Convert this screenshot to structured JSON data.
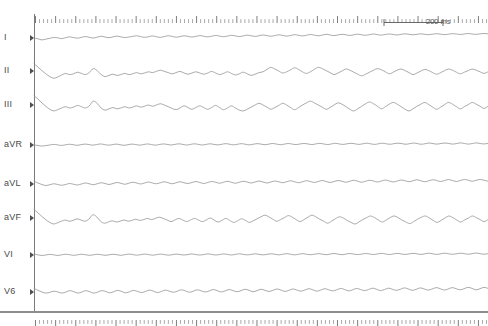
{
  "figure": {
    "type": "ecg-strip",
    "title": "",
    "background_color": "#ffffff",
    "trace_color": "#8e8e8e",
    "axis_color": "#7b7b7b",
    "label_color": "#4a4a4a",
    "width_px": 488,
    "height_px": 326
  },
  "scale": {
    "label": "200 ms",
    "value": 200,
    "unit": "ms",
    "bar_length_px": 60
  },
  "ruler": {
    "top_name": "time-ruler-top",
    "bottom_name": "time-ruler-bottom",
    "major_every": 5,
    "tick_count": 113
  },
  "leads": [
    {
      "label": "I",
      "baseline_y": 38
    },
    {
      "label": "II",
      "baseline_y": 71
    },
    {
      "label": "III",
      "baseline_y": 105
    },
    {
      "label": "aVR",
      "baseline_y": 145
    },
    {
      "label": "aVL",
      "baseline_y": 184
    },
    {
      "label": "aVF",
      "baseline_y": 218
    },
    {
      "label": "VI",
      "baseline_y": 255
    },
    {
      "label": "V6",
      "baseline_y": 292
    }
  ],
  "chart_data": {
    "type": "line",
    "xlabel": "Time",
    "ylabel": "Amplitude",
    "x_unit": "ms",
    "legend_position": "left-labels",
    "grid": false,
    "x_axis": {
      "visible_ruler": true,
      "scale_bar_ms": 200,
      "duration_ms_approx": 1500
    },
    "series": [
      {
        "name": "I",
        "amplitude_scale": 3.2,
        "values": [
          0.0,
          -0.25,
          -0.6,
          -0.35,
          -0.1,
          0.15,
          0.05,
          -0.2,
          0.1,
          0.35,
          0.15,
          -0.05,
          0.2,
          0.45,
          0.2,
          0.0,
          0.25,
          0.55,
          0.3,
          0.1,
          0.35,
          0.6,
          0.35,
          0.15,
          0.3,
          0.5,
          0.7,
          0.45,
          0.2,
          0.4,
          0.65,
          0.4,
          0.2,
          0.45,
          0.7,
          0.5,
          0.25,
          0.45,
          0.7,
          0.5,
          0.3,
          0.5,
          0.75,
          0.55,
          0.35,
          0.55,
          0.8,
          0.6,
          0.4,
          0.6,
          0.85,
          0.65,
          0.45,
          0.65,
          0.9,
          0.7,
          0.5,
          0.7,
          0.95,
          0.75,
          0.55,
          0.75,
          1.0,
          0.8,
          0.6,
          0.8,
          1.05,
          0.85,
          0.65,
          0.85,
          1.1,
          0.9,
          0.7,
          0.9,
          1.15,
          0.95,
          0.75,
          0.95,
          1.15,
          1.0,
          0.8,
          1.0,
          1.2,
          1.0,
          0.85,
          1.05,
          1.25,
          1.05,
          0.9,
          1.1,
          1.25,
          1.1,
          0.95,
          1.15,
          1.3,
          1.15,
          1.0,
          1.15,
          1.3,
          1.15,
          1.05,
          1.2,
          1.35,
          1.2,
          1.05,
          1.2,
          1.35,
          1.25,
          1.1,
          1.25,
          1.4,
          1.25,
          1.15,
          1.3,
          1.4,
          1.3
        ]
      },
      {
        "name": "II",
        "amplitude_scale": 8.0,
        "values": [
          0.9,
          0.5,
          0.05,
          -0.35,
          -0.7,
          -0.9,
          -0.75,
          -0.5,
          -0.3,
          -0.45,
          -0.35,
          -0.15,
          -0.3,
          -0.45,
          -0.2,
          0.3,
          0.05,
          -0.45,
          -0.7,
          -0.55,
          -0.4,
          -0.55,
          -0.45,
          -0.3,
          -0.45,
          -0.35,
          -0.2,
          -0.35,
          -0.25,
          -0.1,
          -0.2,
          -0.05,
          0.1,
          -0.05,
          -0.2,
          -0.35,
          -0.2,
          -0.05,
          -0.25,
          -0.4,
          -0.25,
          -0.1,
          -0.25,
          -0.4,
          -0.25,
          -0.05,
          -0.25,
          -0.45,
          -0.3,
          -0.1,
          -0.3,
          -0.5,
          -0.35,
          -0.15,
          -0.35,
          -0.55,
          -0.4,
          -0.2,
          -0.1,
          0.2,
          0.45,
          0.25,
          0.0,
          -0.25,
          -0.1,
          0.15,
          0.4,
          0.2,
          -0.1,
          -0.3,
          -0.1,
          0.2,
          0.45,
          0.3,
          0.05,
          -0.2,
          -0.45,
          -0.25,
          0.0,
          0.25,
          0.1,
          -0.15,
          -0.4,
          -0.6,
          -0.4,
          -0.15,
          0.1,
          0.3,
          0.15,
          -0.1,
          -0.35,
          -0.15,
          0.1,
          0.25,
          0.05,
          -0.2,
          -0.45,
          -0.25,
          0.0,
          0.2,
          0.05,
          -0.2,
          -0.4,
          -0.2,
          0.05,
          0.25,
          0.1,
          -0.15,
          -0.35,
          -0.15,
          0.05,
          0.25,
          0.1,
          -0.1,
          -0.3,
          -0.1
        ]
      },
      {
        "name": "III",
        "amplitude_scale": 8.5,
        "values": [
          1.1,
          0.7,
          0.25,
          -0.15,
          -0.5,
          -0.7,
          -0.55,
          -0.35,
          -0.2,
          -0.35,
          -0.25,
          -0.05,
          -0.2,
          -0.35,
          -0.1,
          0.45,
          0.2,
          -0.35,
          -0.6,
          -0.45,
          -0.3,
          -0.45,
          -0.35,
          -0.2,
          -0.35,
          -0.25,
          -0.1,
          -0.25,
          -0.15,
          0.0,
          -0.15,
          0.0,
          0.15,
          0.0,
          -0.2,
          -0.4,
          -0.55,
          -0.35,
          -0.1,
          -0.3,
          -0.5,
          -0.3,
          -0.1,
          -0.3,
          -0.5,
          -0.3,
          -0.05,
          -0.3,
          -0.55,
          -0.35,
          -0.1,
          -0.35,
          -0.6,
          -0.7,
          -0.5,
          -0.25,
          0.0,
          0.2,
          0.0,
          -0.25,
          -0.5,
          -0.3,
          -0.05,
          0.2,
          0.0,
          -0.3,
          -0.55,
          -0.3,
          0.0,
          0.25,
          0.45,
          0.25,
          0.0,
          -0.25,
          -0.5,
          -0.3,
          0.0,
          0.25,
          0.1,
          -0.2,
          -0.5,
          -0.7,
          -0.45,
          -0.15,
          0.15,
          0.35,
          0.15,
          -0.15,
          -0.45,
          -0.2,
          0.1,
          0.3,
          0.1,
          -0.2,
          -0.5,
          -0.7,
          -0.45,
          -0.15,
          0.1,
          0.3,
          0.05,
          -0.25,
          -0.5,
          -0.25,
          0.05,
          0.3,
          0.1,
          -0.2,
          -0.45,
          -0.2,
          0.05,
          0.3,
          0.1,
          -0.15,
          -0.4,
          -0.15
        ]
      },
      {
        "name": "aVR",
        "amplitude_scale": 3.0,
        "values": [
          0.0,
          -0.15,
          -0.35,
          -0.2,
          0.0,
          0.2,
          0.05,
          -0.15,
          0.05,
          0.25,
          0.1,
          -0.1,
          0.1,
          0.3,
          0.15,
          -0.05,
          0.15,
          0.35,
          0.15,
          -0.05,
          0.1,
          0.3,
          0.1,
          -0.1,
          0.1,
          0.3,
          0.15,
          -0.05,
          0.15,
          0.35,
          0.15,
          -0.05,
          0.15,
          0.35,
          0.2,
          0.0,
          0.2,
          0.4,
          0.2,
          0.0,
          0.2,
          0.4,
          0.2,
          0.0,
          0.2,
          0.4,
          0.2,
          0.05,
          0.25,
          0.45,
          0.25,
          0.05,
          0.25,
          0.45,
          0.25,
          0.05,
          0.25,
          0.45,
          0.3,
          0.1,
          0.3,
          0.5,
          0.3,
          0.1,
          0.3,
          0.5,
          0.3,
          0.15,
          0.35,
          0.5,
          0.35,
          0.15,
          0.35,
          0.55,
          0.35,
          0.15,
          0.35,
          0.55,
          0.35,
          0.2,
          0.4,
          0.55,
          0.4,
          0.2,
          0.4,
          0.6,
          0.4,
          0.2,
          0.4,
          0.6,
          0.4,
          0.25,
          0.45,
          0.6,
          0.45,
          0.25,
          0.45,
          0.65,
          0.45,
          0.25,
          0.45,
          0.65,
          0.45,
          0.3,
          0.5,
          0.65,
          0.5,
          0.3,
          0.5,
          0.7,
          0.5,
          0.3,
          0.5,
          0.7,
          0.5,
          0.35,
          0.55
        ]
      },
      {
        "name": "aVL",
        "amplitude_scale": 5.0,
        "values": [
          0.55,
          0.2,
          -0.1,
          -0.3,
          -0.15,
          0.05,
          -0.1,
          -0.25,
          -0.1,
          0.1,
          -0.05,
          -0.2,
          0.0,
          0.2,
          0.05,
          -0.15,
          0.05,
          0.25,
          0.1,
          -0.1,
          0.1,
          0.3,
          0.15,
          -0.05,
          0.15,
          0.35,
          0.2,
          0.0,
          0.2,
          0.4,
          0.2,
          0.05,
          0.25,
          0.45,
          0.25,
          0.05,
          0.25,
          0.45,
          0.25,
          0.1,
          0.3,
          0.5,
          0.3,
          0.1,
          0.3,
          0.5,
          0.35,
          0.15,
          0.35,
          0.55,
          0.35,
          0.15,
          0.35,
          0.55,
          0.4,
          0.2,
          0.4,
          0.6,
          0.4,
          0.2,
          0.4,
          0.6,
          0.45,
          0.25,
          0.45,
          0.65,
          0.45,
          0.25,
          0.45,
          0.65,
          0.5,
          0.3,
          0.5,
          0.7,
          0.5,
          0.3,
          0.5,
          0.7,
          0.55,
          0.35,
          0.55,
          0.75,
          0.55,
          0.35,
          0.55,
          0.75,
          0.6,
          0.4,
          0.6,
          0.8,
          0.6,
          0.4,
          0.6,
          0.8,
          0.65,
          0.45,
          0.65,
          0.85,
          0.65,
          0.45,
          0.65,
          0.85,
          0.7,
          0.5,
          0.7,
          0.9,
          0.7,
          0.5,
          0.7,
          0.9,
          0.75,
          0.55,
          0.75,
          0.9,
          0.75,
          0.55
        ]
      },
      {
        "name": "aVF",
        "amplitude_scale": 8.0,
        "values": [
          1.05,
          0.65,
          0.2,
          -0.2,
          -0.55,
          -0.75,
          -0.6,
          -0.4,
          -0.25,
          -0.4,
          -0.3,
          -0.1,
          -0.25,
          -0.4,
          -0.15,
          0.4,
          0.15,
          -0.4,
          -0.65,
          -0.5,
          -0.35,
          -0.5,
          -0.4,
          -0.25,
          -0.4,
          -0.3,
          -0.15,
          -0.3,
          -0.2,
          -0.05,
          -0.2,
          -0.05,
          0.1,
          -0.05,
          -0.25,
          -0.45,
          -0.25,
          -0.05,
          -0.25,
          -0.45,
          -0.25,
          -0.05,
          -0.25,
          -0.45,
          -0.25,
          0.0,
          -0.25,
          -0.5,
          -0.3,
          -0.05,
          -0.3,
          -0.55,
          -0.35,
          -0.1,
          -0.3,
          -0.55,
          -0.35,
          -0.1,
          0.15,
          0.35,
          0.15,
          -0.15,
          -0.4,
          -0.2,
          0.05,
          0.3,
          0.1,
          -0.2,
          -0.45,
          -0.2,
          0.1,
          0.35,
          0.15,
          -0.15,
          -0.4,
          -0.65,
          -0.4,
          -0.1,
          0.15,
          0.0,
          -0.3,
          -0.55,
          -0.75,
          -0.5,
          -0.2,
          0.05,
          0.25,
          0.05,
          -0.25,
          -0.5,
          -0.25,
          0.05,
          0.25,
          0.05,
          -0.25,
          -0.5,
          -0.7,
          -0.45,
          -0.15,
          0.1,
          0.25,
          0.0,
          -0.3,
          -0.55,
          -0.3,
          0.0,
          0.25,
          0.05,
          -0.25,
          -0.5,
          -0.25,
          0.0,
          0.25,
          0.05,
          -0.2,
          -0.45,
          -0.2
        ]
      },
      {
        "name": "VI",
        "amplitude_scale": 3.0,
        "values": [
          0.3,
          0.05,
          -0.15,
          0.0,
          0.2,
          0.05,
          -0.15,
          0.05,
          0.25,
          0.1,
          -0.1,
          0.05,
          0.25,
          0.1,
          -0.1,
          0.05,
          0.25,
          0.1,
          -0.1,
          0.05,
          0.25,
          0.1,
          -0.1,
          0.1,
          0.3,
          0.15,
          -0.05,
          0.1,
          0.3,
          0.15,
          -0.05,
          0.1,
          0.3,
          0.15,
          -0.05,
          0.1,
          0.3,
          0.15,
          0.0,
          0.15,
          0.35,
          0.15,
          0.0,
          0.15,
          0.35,
          0.2,
          0.0,
          0.15,
          0.35,
          0.2,
          0.0,
          0.2,
          0.4,
          0.2,
          0.05,
          0.2,
          0.4,
          0.2,
          0.05,
          0.2,
          0.4,
          0.25,
          0.05,
          0.25,
          0.45,
          0.25,
          0.05,
          0.25,
          0.45,
          0.25,
          0.1,
          0.25,
          0.45,
          0.3,
          0.1,
          0.3,
          0.5,
          0.3,
          0.1,
          0.3,
          0.5,
          0.3,
          0.15,
          0.3,
          0.5,
          0.35,
          0.15,
          0.35,
          0.55,
          0.35,
          0.15,
          0.35,
          0.55,
          0.35,
          0.2,
          0.35,
          0.55,
          0.4,
          0.2,
          0.4,
          0.6,
          0.4,
          0.2,
          0.4,
          0.6,
          0.4,
          0.25,
          0.4,
          0.6,
          0.45,
          0.25,
          0.45,
          0.65,
          0.45,
          0.25,
          0.45
        ]
      },
      {
        "name": "V6",
        "amplitude_scale": 5.5,
        "values": [
          0.65,
          0.3,
          0.0,
          -0.2,
          -0.05,
          0.15,
          0.0,
          -0.2,
          0.0,
          0.25,
          0.05,
          -0.2,
          0.0,
          0.25,
          0.05,
          -0.2,
          0.0,
          0.25,
          0.1,
          -0.15,
          0.05,
          0.3,
          0.1,
          -0.15,
          0.05,
          0.3,
          0.1,
          -0.1,
          0.1,
          0.35,
          0.15,
          -0.1,
          0.1,
          0.35,
          0.15,
          -0.05,
          0.15,
          0.4,
          0.2,
          -0.05,
          0.15,
          0.4,
          0.2,
          0.0,
          0.2,
          0.45,
          0.25,
          0.0,
          0.2,
          0.45,
          0.25,
          0.05,
          0.25,
          0.5,
          0.3,
          0.05,
          0.25,
          0.5,
          0.3,
          0.1,
          0.3,
          0.55,
          0.35,
          0.1,
          0.3,
          0.55,
          0.35,
          0.15,
          0.35,
          0.6,
          0.4,
          0.15,
          0.35,
          0.6,
          0.4,
          0.2,
          0.4,
          0.65,
          0.45,
          0.2,
          0.4,
          0.65,
          0.45,
          0.25,
          0.45,
          0.7,
          0.5,
          0.25,
          0.45,
          0.7,
          0.5,
          0.3,
          0.5,
          0.75,
          0.55,
          0.3,
          0.5,
          0.75,
          0.55,
          0.35,
          0.55,
          0.8,
          0.6,
          0.35,
          0.55,
          0.8,
          0.6,
          0.4,
          0.6,
          0.85,
          0.65,
          0.4,
          0.6,
          0.85,
          0.65
        ]
      }
    ]
  }
}
